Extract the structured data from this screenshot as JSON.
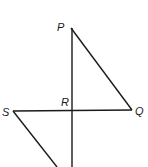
{
  "header": {
    "cut_off_text": ""
  },
  "diagram": {
    "points": [
      {
        "name": "P",
        "x": 71,
        "y": 28,
        "label_x": 57,
        "label_y": 31
      },
      {
        "name": "Q",
        "x": 132,
        "y": 110,
        "label_x": 136,
        "label_y": 115
      },
      {
        "name": "S",
        "x": 13,
        "y": 111,
        "label_x": 2,
        "label_y": 116
      },
      {
        "name": "R",
        "x": 72,
        "y": 111,
        "label_x": 62,
        "label_y": 106
      }
    ],
    "labels": {
      "P": "P",
      "Q": "Q",
      "R": "R",
      "S": "S"
    },
    "segments": [
      {
        "name": "PQ",
        "from": "P",
        "to": "Q"
      },
      {
        "name": "SQ",
        "from": "S",
        "to": "Q"
      },
      {
        "name": "P-vertical",
        "from": "P",
        "to": "bottom"
      },
      {
        "name": "S-down",
        "from": "S",
        "to": "bottom-left"
      }
    ]
  }
}
